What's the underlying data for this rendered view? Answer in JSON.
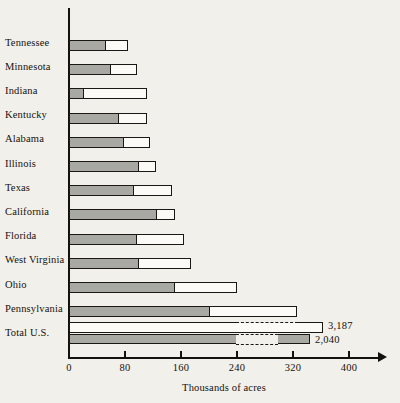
{
  "chart_data": {
    "type": "bar",
    "orientation": "horizontal",
    "title": "",
    "xlabel": "Thousands of acres",
    "ylabel": "",
    "xlim": [
      0,
      440
    ],
    "grid": false,
    "legend": null,
    "tick_labels": [
      "0",
      "80",
      "160",
      "240",
      "320",
      "400"
    ],
    "tick_values": [
      0,
      80,
      160,
      240,
      320,
      400
    ],
    "categories": [
      "Tennessee",
      "Minnesota",
      "Indiana",
      "Kentucky",
      "Alabama",
      "Illinois",
      "Texas",
      "California",
      "Florida",
      "West Virginia",
      "Ohio",
      "Pennsylvania",
      "Total U.S."
    ],
    "series": [
      {
        "name": "inner-shaded",
        "values": [
          51,
          58,
          20,
          70,
          77,
          98,
          91,
          124,
          95,
          98,
          150,
          200,
          2040
        ]
      },
      {
        "name": "outer-total",
        "values": [
          84,
          97,
          111,
          111,
          115,
          124,
          147,
          151,
          164,
          174,
          240,
          326,
          3187
        ]
      }
    ],
    "annotations": [
      {
        "text": "3,187",
        "series": "outer-total",
        "category": "Total U.S."
      },
      {
        "text": "2,040",
        "series": "inner-shaded",
        "category": "Total U.S."
      }
    ],
    "scale_break": {
      "category": "Total U.S.",
      "note": "Total U.S. bars are drawn with a broken (dashed) scale"
    },
    "colors": {
      "inner_fill": "#a9a9a4",
      "outer_fill": "#fbfaf6",
      "outline": "#1b1714",
      "background": "#f2f0ea",
      "text": "#15110e"
    }
  },
  "rows": [
    {
      "label": "Tennessee"
    },
    {
      "label": "Minnesota"
    },
    {
      "label": "Indiana"
    },
    {
      "label": "Kentucky"
    },
    {
      "label": "Alabama"
    },
    {
      "label": "Illinois"
    },
    {
      "label": "Texas"
    },
    {
      "label": "California"
    },
    {
      "label": "Florida"
    },
    {
      "label": "West Virginia"
    },
    {
      "label": "Ohio"
    },
    {
      "label": "Pennsylvania"
    },
    {
      "label": "Total U.S."
    }
  ],
  "axis": {
    "title": "Thousands of acres",
    "ticks": [
      "0",
      "80",
      "160",
      "240",
      "320",
      "400"
    ]
  },
  "total_us_labels": {
    "outer": "3,187",
    "inner": "2,040"
  }
}
